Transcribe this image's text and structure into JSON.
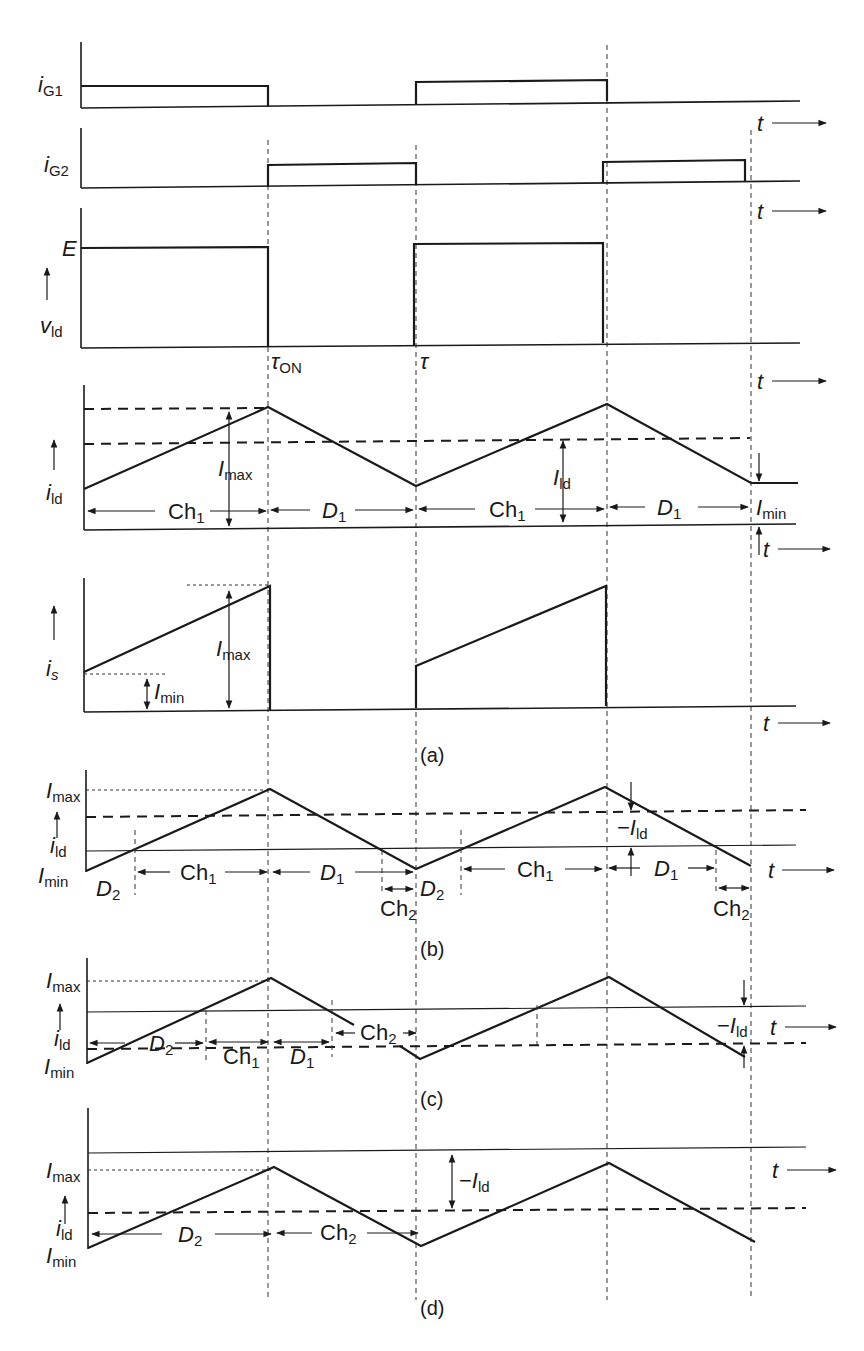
{
  "figure": {
    "guides_x": [
      268,
      416,
      607,
      752
    ],
    "panels": {
      "ig1": {
        "label_main": "i",
        "label_sub": "G1",
        "label_xy": [
          38,
          147
        ],
        "t_label": "t"
      },
      "ig2": {
        "label_main": "i",
        "label_sub": "G2",
        "label_xy": [
          44,
          278
        ],
        "t_label": "t"
      },
      "vld": {
        "level_label": "E",
        "label_main": "v",
        "label_sub": "ld",
        "tau_on": "τON",
        "tau": "τ",
        "t_label": "t"
      },
      "ild_a": {
        "label_main": "i",
        "label_sub": "ld",
        "imax": "Imax",
        "ild": "Ild",
        "imin": "Imin",
        "intervals": [
          "Ch1",
          "D1",
          "Ch1",
          "D1"
        ],
        "t_label": "t"
      },
      "is": {
        "label_main": "i",
        "label_sub": "s",
        "imax": "Imax",
        "imin": "Imin",
        "t_label": "t"
      },
      "b": {
        "imax": "Imax",
        "ild": "ild",
        "imin": "Imin",
        "neg_ild": "−Ild",
        "intervals": [
          "D2",
          "Ch1",
          "D1",
          "Ch2",
          "D2",
          "Ch1",
          "D1",
          "Ch2"
        ],
        "t_label": "t"
      },
      "c": {
        "imax": "Imax",
        "ild": "ild",
        "imin": "Imin",
        "neg_ild": "−Ild",
        "intervals": [
          "D2",
          "Ch1",
          "D1",
          "Ch2"
        ],
        "t_label": "t"
      },
      "d": {
        "imax": "Imax",
        "ild": "ild",
        "imin": "Imin",
        "neg_ild": "−Ild",
        "intervals": [
          "D2",
          "Ch2"
        ],
        "t_label": "t"
      }
    },
    "captions": [
      "(a)",
      "(b)",
      "(c)",
      "(d)"
    ]
  }
}
